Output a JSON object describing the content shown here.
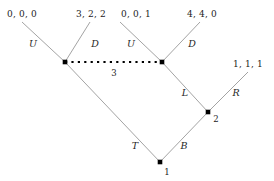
{
  "figure": {
    "kind": "extensive-form-game-tree",
    "width": 274,
    "height": 181,
    "line_color": "#8c8c8c",
    "node_color": "#000000",
    "text_color": "#1c1c1c"
  },
  "payoffs": [
    {
      "id": "payoff-left-U",
      "text": "0, 0, 0",
      "x": 22,
      "y": 14
    },
    {
      "id": "payoff-left-D",
      "text": "3, 2, 2",
      "x": 91,
      "y": 14
    },
    {
      "id": "payoff-right-U",
      "text": "0, 0, 1",
      "x": 136,
      "y": 14
    },
    {
      "id": "payoff-right-D",
      "text": "4, 4, 0",
      "x": 202,
      "y": 14
    },
    {
      "id": "payoff-node2-R",
      "text": "1, 1, 1",
      "x": 248,
      "y": 64
    }
  ],
  "actions": [
    {
      "id": "action-left-U",
      "text": "U",
      "x": 33,
      "y": 44
    },
    {
      "id": "action-left-D",
      "text": "D",
      "x": 95,
      "y": 44
    },
    {
      "id": "action-right-U",
      "text": "U",
      "x": 131,
      "y": 44
    },
    {
      "id": "action-right-D",
      "text": "D",
      "x": 192,
      "y": 44
    },
    {
      "id": "action-node2-L",
      "text": "L",
      "x": 185,
      "y": 93
    },
    {
      "id": "action-node2-R",
      "text": "R",
      "x": 236,
      "y": 93
    },
    {
      "id": "action-node1-T",
      "text": "T",
      "x": 135,
      "y": 146
    },
    {
      "id": "action-node1-B",
      "text": "B",
      "x": 184,
      "y": 146
    }
  ],
  "player_labels": [
    {
      "id": "player-1",
      "text": "1",
      "x": 167,
      "y": 172
    },
    {
      "id": "player-2",
      "text": "2",
      "x": 216,
      "y": 119
    },
    {
      "id": "player-3-infoset",
      "text": "3",
      "x": 114,
      "y": 73
    }
  ],
  "nodes": [
    {
      "id": "node-infoset-left",
      "x": 65,
      "y": 62,
      "player": "3"
    },
    {
      "id": "node-infoset-right",
      "x": 162,
      "y": 62,
      "player": "3"
    },
    {
      "id": "node-player-2",
      "x": 208,
      "y": 112,
      "player": "2"
    },
    {
      "id": "node-player-1",
      "x": 160,
      "y": 162,
      "player": "1"
    }
  ],
  "edges": [
    {
      "id": "edge-left-U",
      "x1": 65,
      "y1": 62,
      "x2": 22,
      "y2": 22
    },
    {
      "id": "edge-left-D",
      "x1": 65,
      "y1": 62,
      "x2": 90,
      "y2": 22
    },
    {
      "id": "edge-right-U",
      "x1": 162,
      "y1": 62,
      "x2": 120,
      "y2": 22
    },
    {
      "id": "edge-right-D",
      "x1": 162,
      "y1": 62,
      "x2": 200,
      "y2": 22
    },
    {
      "id": "edge-node1-T",
      "x1": 160,
      "y1": 162,
      "x2": 65,
      "y2": 62
    },
    {
      "id": "edge-node1-B",
      "x1": 160,
      "y1": 162,
      "x2": 208,
      "y2": 112
    },
    {
      "id": "edge-node2-L",
      "x1": 208,
      "y1": 112,
      "x2": 162,
      "y2": 62
    },
    {
      "id": "edge-node2-R",
      "x1": 208,
      "y1": 112,
      "x2": 248,
      "y2": 72
    }
  ],
  "information_set": {
    "id": "infoset-dotted-link",
    "x1": 65,
    "y1": 62,
    "x2": 162,
    "y2": 62,
    "style": "dotted"
  }
}
